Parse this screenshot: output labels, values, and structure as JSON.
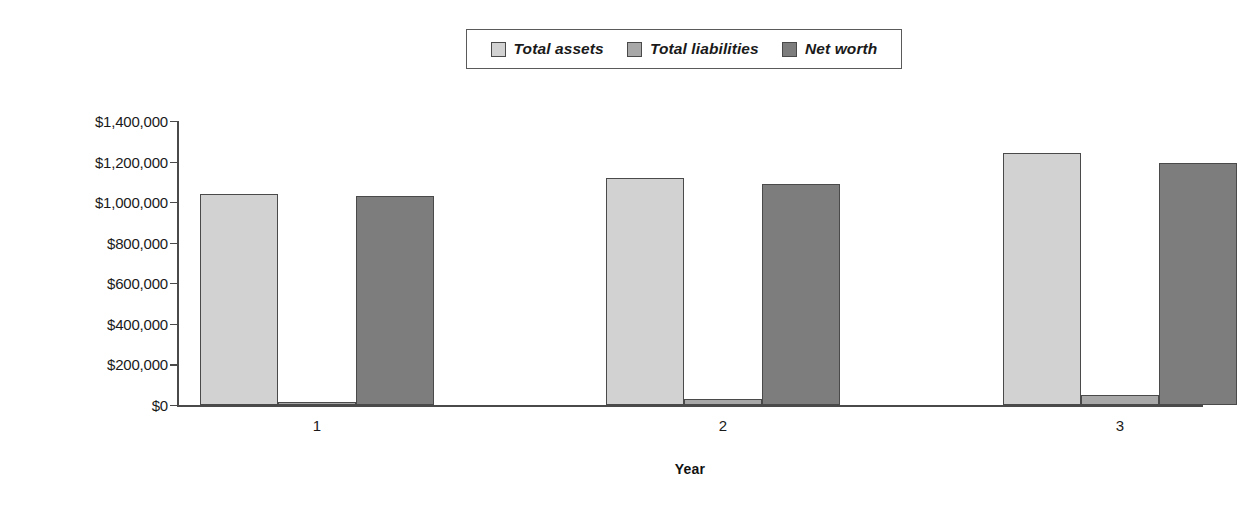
{
  "chart_data": {
    "type": "bar",
    "title": "",
    "xlabel": "Year",
    "ylabel": "",
    "categories": [
      "1",
      "2",
      "3"
    ],
    "ylim": [
      0,
      1400000
    ],
    "ytick_labels": [
      "$1,400,000",
      "$1,200,000",
      "$1,000,000",
      "$800,000",
      "$600,000",
      "$400,000",
      "$200,000",
      "$0"
    ],
    "ytick_values": [
      1400000,
      1200000,
      1000000,
      800000,
      600000,
      400000,
      200000,
      0
    ],
    "grid": false,
    "legend_position": "top-center",
    "series": [
      {
        "name": "Total assets",
        "color": "#d2d2d2",
        "values": [
          1040000,
          1120000,
          1240000
        ]
      },
      {
        "name": "Total liabilities",
        "color": "#a8a8a8",
        "values": [
          15000,
          30000,
          50000
        ]
      },
      {
        "name": "Net worth",
        "color": "#7d7d7d",
        "values": [
          1030000,
          1090000,
          1195000
        ]
      }
    ]
  },
  "legend": {
    "items": [
      {
        "label": "Total assets",
        "swatch": "#d2d2d2"
      },
      {
        "label": "Total liabilities",
        "swatch": "#a8a8a8"
      },
      {
        "label": "Net worth",
        "swatch": "#7d7d7d"
      }
    ]
  },
  "axes": {
    "x_title": "Year",
    "y_ticks": [
      "$1,400,000",
      "$1,200,000",
      "$1,000,000",
      "$800,000",
      "$600,000",
      "$400,000",
      "$200,000",
      "$0"
    ],
    "x_categories": [
      "1",
      "2",
      "3"
    ]
  }
}
